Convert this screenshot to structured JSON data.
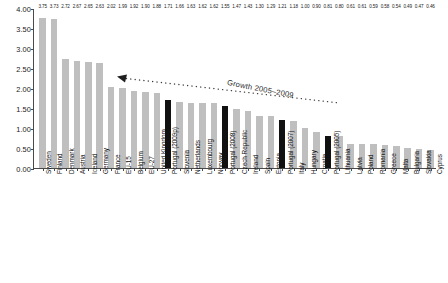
{
  "chart_data": {
    "type": "bar",
    "title": "",
    "xlabel": "",
    "ylabel": "",
    "ylim": [
      0.0,
      4.0
    ],
    "ytick_labels": [
      "4.00",
      "3.50",
      "3.00",
      "2.50",
      "2.00",
      "1.50",
      "1.00",
      "0.50",
      "0.00"
    ],
    "ytick_values": [
      4.0,
      3.5,
      3.0,
      2.5,
      2.0,
      1.5,
      1.0,
      0.5,
      0.0
    ],
    "grid": false,
    "legend": "none",
    "highlight_color": "#111111",
    "bar_color": "#bfbfbf",
    "annotation": {
      "text": "Growth 2005–2009",
      "arrow": "dotted-line-with-left-arrowhead"
    },
    "categories": [
      "Sweden",
      "Finland",
      "Denmark",
      "Austria",
      "Iceland",
      "Germany",
      "France",
      "EU-15",
      "Belgium",
      "EU-27",
      "United Kingdom",
      "Portugal (2009p)",
      "Slovenia",
      "Netherlands",
      "Luxembourg",
      "Norway",
      "Portugal (2008)",
      "Czech Republic",
      "Ireland",
      "Spain",
      "Estonia",
      "Portugal (2007)",
      "Italy",
      "Hungary",
      "Croatia",
      "Portugal (2005)",
      "Lithuania",
      "Latvia",
      "Poland",
      "Romania",
      "Greece",
      "Malta",
      "Bulgaria",
      "Slovakia",
      "Cyprus"
    ],
    "values": [
      3.75,
      3.73,
      2.72,
      2.67,
      2.65,
      2.63,
      2.02,
      1.99,
      1.92,
      1.9,
      1.88,
      1.71,
      1.66,
      1.63,
      1.62,
      1.62,
      1.55,
      1.47,
      1.43,
      1.3,
      1.29,
      1.21,
      1.18,
      1.0,
      0.9,
      0.81,
      0.8,
      0.61,
      0.61,
      0.59,
      0.58,
      0.54,
      0.49,
      0.47,
      0.46
    ],
    "highlighted": [
      false,
      false,
      false,
      false,
      false,
      false,
      false,
      false,
      false,
      false,
      false,
      true,
      false,
      false,
      false,
      false,
      true,
      false,
      false,
      false,
      false,
      true,
      false,
      false,
      false,
      true,
      false,
      false,
      false,
      false,
      false,
      false,
      false,
      false,
      false
    ],
    "value_labels": [
      "3.75",
      "3.73",
      "2.72",
      "2.67",
      "2.65",
      "2.63",
      "2.02",
      "1.99",
      "1.92",
      "1.90",
      "1.88",
      "1.71",
      "1.66",
      "1.63",
      "1.62",
      "1.62",
      "1.55",
      "1.47",
      "1.43",
      "1.30",
      "1.29",
      "1.21",
      "1.18",
      "1.00",
      "0.90",
      "0.81",
      "0.80",
      "0.61",
      "0.61",
      "0.59",
      "0.58",
      "0.54",
      "0.49",
      "0.47",
      "0.46"
    ]
  }
}
